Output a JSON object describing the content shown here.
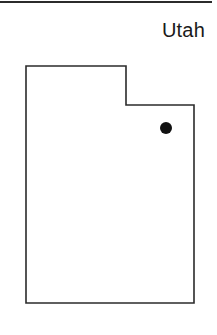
{
  "figure": {
    "width": 217,
    "height": 335,
    "background_color": "#ffffff"
  },
  "title": {
    "text": "Utah",
    "color": "#1a1a1a",
    "align": "right"
  },
  "top_rule": {
    "color": "#2b2b2b",
    "thickness": 2
  },
  "map": {
    "region_name": "Utah",
    "outline_color": "#2b2b2b",
    "outline_width": 1.6,
    "fill_color": "#ffffff",
    "outline_path": "M 26 66 L 126 66 L 126 105 L 194 105 L 194 303 L 26 303 Z",
    "bounds": {
      "left": 26,
      "top": 66,
      "right": 194,
      "bottom": 303
    },
    "notch": {
      "x": 126,
      "y": 105,
      "description": "rectangular notch cut from upper-right corner"
    }
  },
  "markers": [
    {
      "name": "city-marker",
      "label": "",
      "shape": "circle",
      "cx": 166,
      "cy": 128,
      "radius": 6,
      "color": "#111111"
    }
  ]
}
